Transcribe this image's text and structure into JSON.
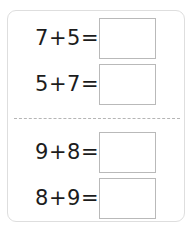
{
  "worksheet": {
    "background_color": "#ffffff",
    "card_border_color": "#dedede",
    "divider_color": "#b5b5b5",
    "box_border_color": "#b9b9b9",
    "text_color": "#1c1c1c",
    "sections": [
      {
        "name": "top-section",
        "problems": [
          {
            "expression": "7+5=",
            "answer": ""
          },
          {
            "expression": "5+7=",
            "answer": ""
          }
        ]
      },
      {
        "name": "bottom-section",
        "problems": [
          {
            "expression": "9+8=",
            "answer": ""
          },
          {
            "expression": "8+9=",
            "answer": ""
          }
        ]
      }
    ]
  }
}
